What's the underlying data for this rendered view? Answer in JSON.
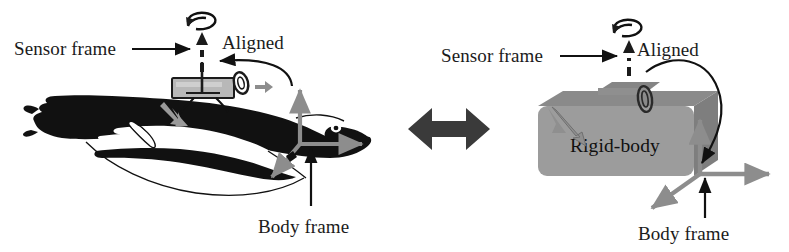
{
  "figure": {
    "width": 789,
    "height": 252,
    "background_color": "#ffffff"
  },
  "labels": {
    "sensor_frame_left": "Sensor frame",
    "aligned_left": "Aligned",
    "body_frame_left": "Body frame",
    "sensor_frame_right": "Sensor frame",
    "aligned_right": "Aligned",
    "body_frame_right": "Body frame",
    "rigid_body": "Rigid-body"
  },
  "colors": {
    "ink": "#111111",
    "axis_gray": "#8d8d8d",
    "box_gray": "#9a9a9a",
    "box_gray_top": "#8a8a8a",
    "box_gray_side": "#7e7e7e",
    "sensor_gray": "#b5b5b5",
    "equivalence_arrow": "#3a3a3a",
    "background": "#ffffff"
  },
  "icons": {
    "sensor_frame_pointer": "right-arrow-icon",
    "aligned_pointer": "curved-arrow-icon",
    "body_frame_pointer": "up-arrow-icon",
    "vertical_axis": "up-arrow-icon",
    "horizontal_axis": "right-arrow-icon",
    "depth_axis": "down-left-arrow-icon",
    "rotation_curl": "rotation-curl-icon",
    "equivalence": "double-headed-arrow-icon",
    "sensor_device": "sensor-tag-icon",
    "animal": "dolphin-silhouette-icon",
    "rigid_body_shape": "rigid-body-box-icon"
  }
}
